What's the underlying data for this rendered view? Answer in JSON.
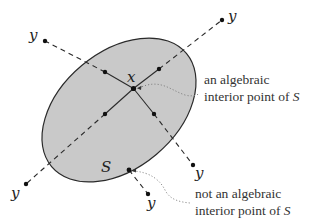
{
  "figure": {
    "set_label": "S",
    "point_label": "x",
    "ray_endpoint_label": "y",
    "annotations": {
      "interior": {
        "line1": "an algebraic",
        "line2_prefix": "interior point of ",
        "line2_symbol": "S"
      },
      "not_interior": {
        "line1": "not an algebraic",
        "line2_prefix": "interior point of ",
        "line2_symbol": "S"
      }
    },
    "colors": {
      "fill": "#c9c9c9",
      "stroke": "#2a2a2a",
      "dotted": "#777777"
    }
  }
}
